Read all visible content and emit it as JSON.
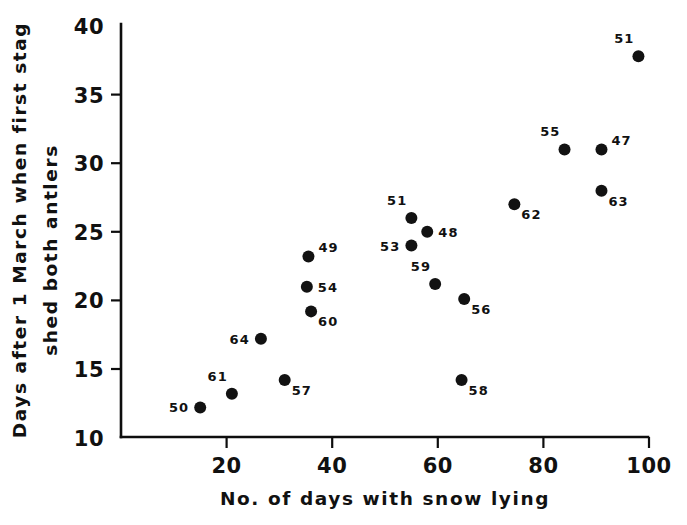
{
  "chart_data": {
    "type": "scatter",
    "title": "",
    "xlabel": "No. of days with snow lying",
    "ylabel_line1": "Days after 1 March when first stag",
    "ylabel_line2": "shed both antlers",
    "xlim": [
      0,
      102
    ],
    "ylim": [
      10,
      40
    ],
    "xticks": [
      20,
      40,
      60,
      80,
      100
    ],
    "yticks": [
      10,
      15,
      20,
      25,
      30,
      35,
      40
    ],
    "grid": false,
    "legend": "none",
    "point_label_note": "Each point is annotated with a two-digit year label",
    "points": [
      {
        "label": "50",
        "x": 15,
        "y": 12.2,
        "label_pos": "left"
      },
      {
        "label": "61",
        "x": 21,
        "y": 13.2,
        "label_pos": "upleft"
      },
      {
        "label": "64",
        "x": 26.5,
        "y": 17.2,
        "label_pos": "left"
      },
      {
        "label": "57",
        "x": 31,
        "y": 14.2,
        "label_pos": "downright"
      },
      {
        "label": "49",
        "x": 35.5,
        "y": 23.2,
        "label_pos": "upright"
      },
      {
        "label": "54",
        "x": 35.2,
        "y": 21.0,
        "label_pos": "right"
      },
      {
        "label": "60",
        "x": 36,
        "y": 19.2,
        "label_pos": "downright"
      },
      {
        "label": "51",
        "x": 55,
        "y": 26.0,
        "label_pos": "upleft"
      },
      {
        "label": "53",
        "x": 55,
        "y": 24.0,
        "label_pos": "left"
      },
      {
        "label": "48",
        "x": 58,
        "y": 25.0,
        "label_pos": "right"
      },
      {
        "label": "59",
        "x": 59.5,
        "y": 21.2,
        "label_pos": "upleft"
      },
      {
        "label": "56",
        "x": 65,
        "y": 20.1,
        "label_pos": "downright"
      },
      {
        "label": "58",
        "x": 64.5,
        "y": 14.2,
        "label_pos": "downright"
      },
      {
        "label": "62",
        "x": 74.5,
        "y": 27.0,
        "label_pos": "downright"
      },
      {
        "label": "55",
        "x": 84,
        "y": 31.0,
        "label_pos": "upleft"
      },
      {
        "label": "47",
        "x": 91,
        "y": 31.0,
        "label_pos": "upright"
      },
      {
        "label": "63",
        "x": 91,
        "y": 28.0,
        "label_pos": "downright"
      },
      {
        "label": "51",
        "x": 98,
        "y": 37.8,
        "label_pos": "upleft"
      }
    ],
    "colors": {
      "marker": "#121212",
      "axis": "#0d0d0d",
      "text": "#111111",
      "background": "#ffffff"
    }
  }
}
